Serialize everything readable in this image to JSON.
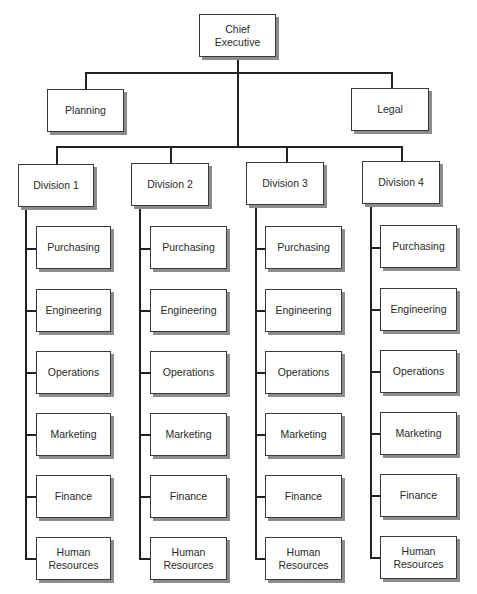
{
  "chart": {
    "root": {
      "label": "Chief\nExecutive"
    },
    "staff": [
      {
        "label": "Planning"
      },
      {
        "label": "Legal"
      }
    ],
    "divisions": [
      {
        "label": "Division 1",
        "functions": [
          "Purchasing",
          "Engineering",
          "Operations",
          "Marketing",
          "Finance",
          "Human\nResources"
        ]
      },
      {
        "label": "Division 2",
        "functions": [
          "Purchasing",
          "Engineering",
          "Operations",
          "Marketing",
          "Finance",
          "Human\nResources"
        ]
      },
      {
        "label": "Division 3",
        "functions": [
          "Purchasing",
          "Engineering",
          "Operations",
          "Marketing",
          "Finance",
          "Human\nResources"
        ]
      },
      {
        "label": "Division 4",
        "functions": [
          "Purchasing",
          "Engineering",
          "Operations",
          "Marketing",
          "Finance",
          "Human\nResources"
        ]
      }
    ]
  },
  "colors": {
    "line": "#222222",
    "border": "#3a3a3a",
    "shadow": "#8c8c8c",
    "background": "#ffffff"
  }
}
